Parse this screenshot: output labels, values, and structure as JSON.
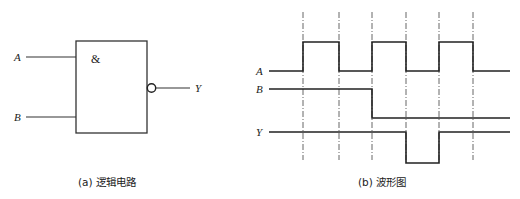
{
  "circuit": {
    "gate_symbol": "&",
    "inputs": [
      "A",
      "B"
    ],
    "output": "Y",
    "gate_type": "NAND",
    "caption": "(a) 逻辑电路"
  },
  "waveform": {
    "caption": "(b) 波形图",
    "signals": [
      {
        "name": "A",
        "levels": [
          0,
          1,
          0,
          1,
          0,
          1,
          0
        ]
      },
      {
        "name": "B",
        "levels": [
          1,
          1,
          1,
          0,
          0,
          0,
          0
        ]
      },
      {
        "name": "Y",
        "levels": [
          1,
          1,
          1,
          1,
          0,
          1,
          1
        ]
      }
    ],
    "time_markers": 6
  }
}
